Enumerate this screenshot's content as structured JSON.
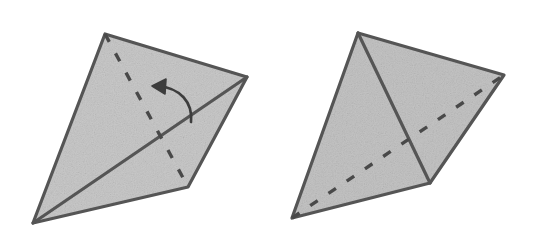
{
  "page": {
    "width": 535,
    "height": 246,
    "background_color": "#ffffff"
  },
  "style": {
    "fill_color": "#c9c9c9",
    "fill_color_secondary": "#c4c4c4",
    "stroke_color": "#555555",
    "dash_color": "#4a4a4a",
    "arrow_color": "#3d3d3d",
    "outline_width": 3.2,
    "crease_width": 3.2,
    "dash_width": 3.4,
    "dash_pattern": "9 13"
  },
  "figures": [
    {
      "id": "figure-left",
      "label": "left-figure-before-fold",
      "caption": "",
      "vertices": {
        "top": [
          105,
          34
        ],
        "right": [
          247,
          77
        ],
        "bottom_right": [
          188,
          187
        ],
        "bottom_left": [
          33,
          223
        ]
      },
      "outline_path": "M105,34 L247,77 L188,187 L33,223 Z",
      "solid_crease": {
        "name": "solid-diagonal-crease",
        "from": [
          33,
          223
        ],
        "to": [
          247,
          77
        ],
        "path": "M33,223 L247,77"
      },
      "dashed_fold": {
        "name": "dashed-fold-line",
        "from": [
          105,
          34
        ],
        "to": [
          188,
          187
        ],
        "path": "M105,34 L188,187"
      },
      "arrow": {
        "name": "fold-direction-arrow",
        "path": "M191,122 C193,102 180,88 158,86",
        "head_points": "152,86 166,79 165,94",
        "direction": "counterclockwise-up-left",
        "meaning": "fold-this-flap-over"
      }
    },
    {
      "id": "figure-right",
      "label": "right-figure-after-fold",
      "caption": "",
      "vertices": {
        "top": [
          358,
          33
        ],
        "right": [
          504,
          75
        ],
        "bottom_middle": [
          430,
          183
        ],
        "bottom_left": [
          292,
          218
        ]
      },
      "outline_path": "M358,33 L504,75 L430,183 L292,218 Z",
      "solid_crease": {
        "name": "solid-fold-crease",
        "from": [
          358,
          33
        ],
        "to": [
          430,
          183
        ],
        "path": "M358,33 L430,183"
      },
      "dashed_fold": {
        "name": "dashed-hidden-edge",
        "from": [
          292,
          218
        ],
        "to": [
          504,
          75
        ],
        "path": "M292,218 L504,75"
      },
      "arrow": null
    }
  ]
}
